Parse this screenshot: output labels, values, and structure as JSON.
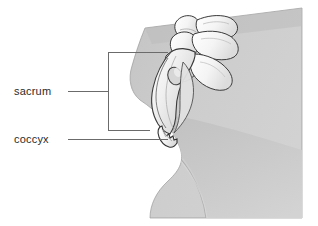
{
  "figure": {
    "background_color": "#ffffff",
    "body_fill": "#c9c9c9",
    "body_fill_dark": "#b9b9b9",
    "body_fill_light": "#d4d4d4",
    "bone_fill": "#fbfbfb",
    "bone_shade": "#d8d8d8",
    "outline_color": "#333333",
    "leader_color": "#6b6b6b"
  },
  "labels": {
    "sacrum": "sacrum",
    "coccyx": "coccyx"
  },
  "annotations": {
    "sacrum_leader_y": 91,
    "coccyx_leader_y": 139,
    "bracket_x": 108,
    "bracket_top_y": 52,
    "bracket_bottom_y": 130
  }
}
